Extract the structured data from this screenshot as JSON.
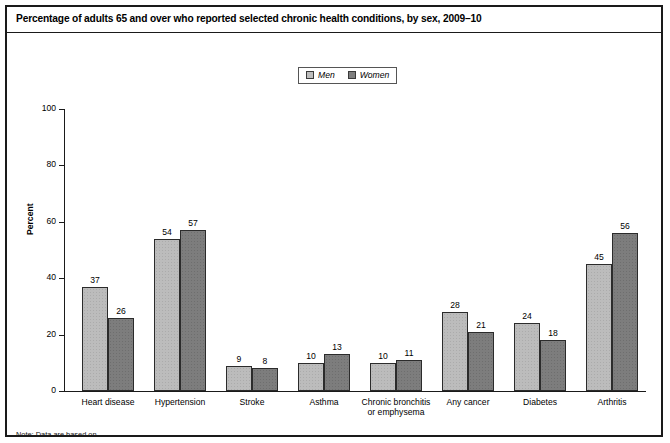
{
  "figure": {
    "title": "Percentage of adults 65 and over who reported selected chronic health conditions, by sex, 2009–10",
    "footnote": "Note: Data are based on…"
  },
  "legend": {
    "items": [
      {
        "label": "Men",
        "color": "#bcbcbc"
      },
      {
        "label": "Women",
        "color": "#7d7d7d"
      }
    ]
  },
  "axis": {
    "y_title": "Percent",
    "y_ticks": [
      "0",
      "20",
      "40",
      "60",
      "80",
      "100"
    ]
  },
  "chart_data": {
    "type": "bar",
    "title": "Percentage of adults 65 and over who reported selected chronic health conditions, by sex, 2009–10",
    "xlabel": "",
    "ylabel": "Percent",
    "ylim": [
      0,
      100
    ],
    "yticks": [
      0,
      20,
      40,
      60,
      80,
      100
    ],
    "grid": false,
    "legend_position": "top-center",
    "categories": [
      "Heart disease",
      "Hypertension",
      "Stroke",
      "Asthma",
      "Chronic bronchitis or emphysema",
      "Any cancer",
      "Diabetes",
      "Arthritis"
    ],
    "category_lines": [
      [
        "Heart disease"
      ],
      [
        "Hypertension"
      ],
      [
        "Stroke"
      ],
      [
        "Asthma"
      ],
      [
        "Chronic bronchitis",
        "or emphysema"
      ],
      [
        "Any cancer"
      ],
      [
        "Diabetes"
      ],
      [
        "Arthritis"
      ]
    ],
    "series": [
      {
        "name": "Men",
        "color": "#bcbcbc",
        "values": [
          37,
          54,
          9,
          10,
          10,
          28,
          24,
          45
        ]
      },
      {
        "name": "Women",
        "color": "#7d7d7d",
        "values": [
          26,
          57,
          8,
          13,
          11,
          21,
          18,
          56
        ]
      }
    ]
  }
}
